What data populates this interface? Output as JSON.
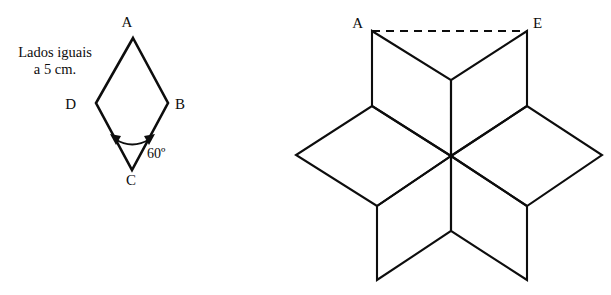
{
  "figure": {
    "caption_note": {
      "line1": "Lados iguais",
      "line2": "a 5 cm."
    },
    "rhombus": {
      "name": "rhombus ABCD",
      "vertices": [
        {
          "label": "A",
          "position": "top",
          "x": 133,
          "y": 38,
          "label_x": 127,
          "label_y": 27
        },
        {
          "label": "B",
          "position": "right",
          "x": 168,
          "y": 103,
          "label_x": 175,
          "label_y": 109
        },
        {
          "label": "C",
          "position": "bottom",
          "x": 132,
          "y": 170,
          "label_x": 131,
          "label_y": 185
        },
        {
          "label": "D",
          "position": "left",
          "x": 96,
          "y": 103,
          "label_x": 76,
          "label_y": 109
        }
      ],
      "angle": {
        "at_vertex": "C",
        "value": "60",
        "unit": "º",
        "text": "60º",
        "label_x": 147,
        "label_y": 158
      },
      "side_length_cm": 5
    },
    "star": {
      "name": "six-rhombus star",
      "center": {
        "x": 451,
        "y": 156
      },
      "outer_tips": [
        {
          "label": "A",
          "x": 372,
          "y": 31,
          "label_x": 357,
          "label_y": 26
        },
        {
          "label": "E",
          "x": 527,
          "y": 31,
          "label_x": 532,
          "label_y": 26
        },
        {
          "label": "",
          "x": 602,
          "y": 155,
          "label_x": 0,
          "label_y": 0
        },
        {
          "label": "",
          "x": 527,
          "y": 280,
          "label_x": 0,
          "label_y": 0
        },
        {
          "label": "",
          "x": 377,
          "y": 280,
          "label_x": 0,
          "label_y": 0
        },
        {
          "label": "",
          "x": 296,
          "y": 155,
          "label_x": 0,
          "label_y": 0
        }
      ],
      "inner_points": [
        {
          "x": 451,
          "y": 80
        },
        {
          "x": 527,
          "y": 106
        },
        {
          "x": 527,
          "y": 206
        },
        {
          "x": 451,
          "y": 231
        },
        {
          "x": 377,
          "y": 206
        },
        {
          "x": 372,
          "y": 106
        }
      ],
      "dashed_segment": {
        "from_label": "A",
        "to_label": "E",
        "x1": 372,
        "y1": 31,
        "x2": 527,
        "y2": 31
      },
      "rhombus_count": 6
    },
    "colors": {
      "ink": "#0d0d0d",
      "background": "#ffffff"
    }
  }
}
